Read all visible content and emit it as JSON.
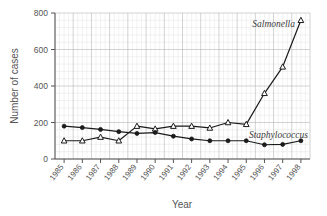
{
  "chart_data": {
    "type": "line",
    "title": "",
    "xlabel": "Year",
    "ylabel": "Number of cases",
    "categories": [
      "1985",
      "1986",
      "1987",
      "1988",
      "1989",
      "1990",
      "1991",
      "1992",
      "1993",
      "1994",
      "1995",
      "1996",
      "1997",
      "1998"
    ],
    "xtick_labels": [
      "1985",
      "1986",
      "1987",
      "1988",
      "1989",
      "1990",
      "1991",
      "1992",
      "1993",
      "1994",
      "1995",
      "1996",
      "1997",
      "1998"
    ],
    "ytick_labels": [
      "0",
      "200",
      "400",
      "600",
      "800"
    ],
    "ytick_values": [
      0,
      200,
      400,
      600,
      800
    ],
    "ylim": [
      0,
      800
    ],
    "grid": true,
    "grid_minor": true,
    "legend_position": "inline-annotation",
    "series": [
      {
        "name": "Salmonella",
        "marker": "open-triangle",
        "color": "#1a1a1a",
        "label_x_year": "1997",
        "values": [
          100,
          100,
          120,
          100,
          180,
          165,
          180,
          180,
          170,
          200,
          190,
          360,
          505,
          760
        ]
      },
      {
        "name": "Staphylococcus",
        "marker": "filled-circle",
        "color": "#1a1a1a",
        "label_x_year": "1996",
        "values": [
          180,
          172,
          162,
          150,
          140,
          145,
          125,
          110,
          100,
          100,
          100,
          78,
          80,
          100
        ]
      }
    ],
    "annotations": [
      {
        "text": "Salmonella",
        "italic": true
      },
      {
        "text": "Staphylococcus",
        "italic": true
      }
    ],
    "colors": {
      "line": "#1a1a1a",
      "grid_major": "#b8b8b8",
      "grid_minor": "#dcdcdc",
      "axis": "#555555",
      "text": "#555555",
      "background": "#ffffff"
    }
  }
}
